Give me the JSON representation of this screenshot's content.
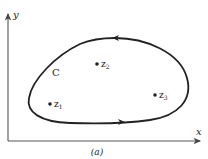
{
  "figure": {
    "caption": "(a)",
    "axes": {
      "x_label": "x",
      "y_label": "y"
    },
    "contour": {
      "label": "C",
      "orientation": "counterclockwise"
    },
    "points": [
      {
        "name": "z1",
        "base": "z",
        "sub": "1"
      },
      {
        "name": "z2",
        "base": "z",
        "sub": "2"
      },
      {
        "name": "z3",
        "base": "z",
        "sub": "3"
      }
    ],
    "colors": {
      "stroke": "#222222",
      "axis": "#555555",
      "background": "#ffffff"
    }
  }
}
